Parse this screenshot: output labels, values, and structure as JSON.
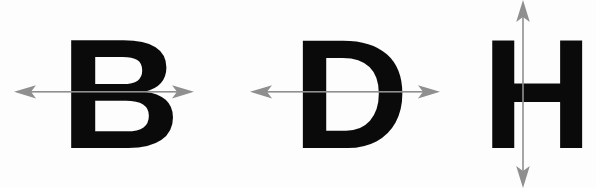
{
  "figure": {
    "background_color": "#fdfdfd",
    "letter_color": "#0a0a0a",
    "arrow_color": "#8f8f8f",
    "width": 596,
    "height": 188
  },
  "items": [
    {
      "letter": "B",
      "symmetry_axis": "horizontal",
      "arrow_icon": "double-headed-horizontal-arrow",
      "axis_position_y": 92,
      "arrow_start_x": 14,
      "arrow_end_x": 194
    },
    {
      "letter": "D",
      "symmetry_axis": "horizontal",
      "arrow_icon": "double-headed-horizontal-arrow",
      "axis_position_y": 92,
      "arrow_start_x": 250,
      "arrow_end_x": 440
    },
    {
      "letter": "H",
      "symmetry_axis": "vertical",
      "arrow_icon": "double-headed-vertical-arrow",
      "axis_position_x": 523,
      "arrow_start_y": 2,
      "arrow_end_y": 186
    }
  ]
}
